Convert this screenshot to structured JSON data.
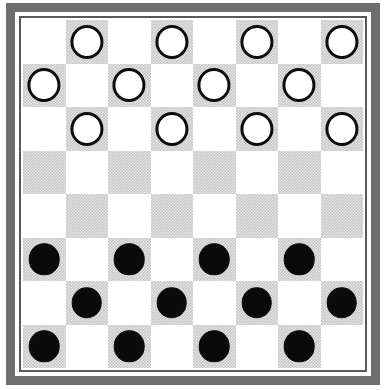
{
  "board": {
    "title": "Checkers Board",
    "rows": 8,
    "columns": 8,
    "light_square_color": "#ffffff",
    "dark_square_color": "#c9c9c9",
    "frame_color": "#6e6e6e",
    "inner_rule_color": "#5a5a5a",
    "white_piece_fill": "#ffffff",
    "white_piece_outline": "#0d0d0d",
    "black_piece_fill": "#0a0a0a",
    "dark_square_parity": 1,
    "piece_counts": {
      "white": 12,
      "black": 12,
      "empty": 40
    },
    "position_name": "Starting position",
    "cells": [
      [
        "",
        "white",
        "",
        "white",
        "",
        "white",
        "",
        "white"
      ],
      [
        "white",
        "",
        "white",
        "",
        "white",
        "",
        "white",
        ""
      ],
      [
        "",
        "white",
        "",
        "white",
        "",
        "white",
        "",
        "white"
      ],
      [
        "",
        "",
        "",
        "",
        "",
        "",
        "",
        ""
      ],
      [
        "",
        "",
        "",
        "",
        "",
        "",
        "",
        ""
      ],
      [
        "black",
        "",
        "black",
        "",
        "black",
        "",
        "black",
        ""
      ],
      [
        "",
        "black",
        "",
        "black",
        "",
        "black",
        "",
        "black"
      ],
      [
        "black",
        "",
        "black",
        "",
        "black",
        "",
        "black",
        ""
      ]
    ]
  }
}
